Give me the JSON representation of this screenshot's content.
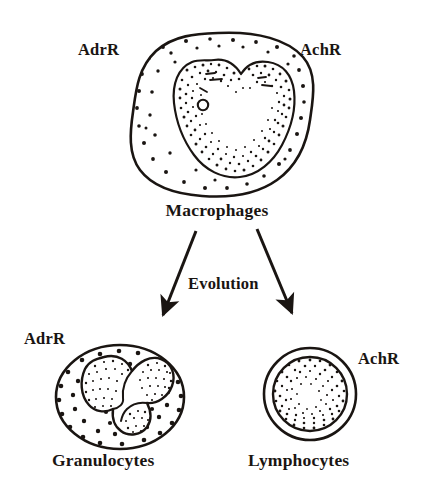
{
  "figure": {
    "kind": "biological-lineage-diagram",
    "background_color": "#ffffff",
    "ink_color": "#1a1512",
    "title_present": false
  },
  "cells": {
    "macrophage": {
      "name": "Macrophages",
      "receptor_left": "AdrR",
      "receptor_right": "AchR",
      "shape": "irregular amoeboid blob",
      "nucleus": "large bean-shaped / kidney-shaped indented nucleus",
      "nucleolus": "small open circle",
      "cytoplasm_texture": "sparse scattered dots",
      "nucleus_texture": "dense stippling concentrated along the nuclear rim"
    },
    "granulocyte": {
      "name": "Granulocytes",
      "receptor_left": "AdrR",
      "shape": "rounded oval",
      "nucleus": "three connected lobes (polymorphonuclear)",
      "cytoplasm_texture": "evenly spaced granule dots",
      "nucleus_texture": "fine stippling inside each lobe"
    },
    "lymphocyte": {
      "name": "Lymphocytes",
      "receptor_right": "AchR",
      "shape": "circle with thin cytoplasm rim",
      "nucleus": "large round nucleus filling most of the cell",
      "cytoplasm_texture": "clear narrow rim",
      "nucleus_texture": "dense stippled ring"
    }
  },
  "process": {
    "label": "Evolution",
    "from": "Macrophages",
    "to": [
      "Granulocytes",
      "Lymphocytes"
    ],
    "arrow_count": 2
  },
  "labels": {
    "adrr_macrophage": "AdrR",
    "achr_macrophage": "AchR",
    "macrophages": "Macrophages",
    "evolution": "Evolution",
    "adrr_granulocyte": "AdrR",
    "achr_lymphocyte": "AchR",
    "granulocytes": "Granulocytes",
    "lymphocytes": "Lymphocytes"
  }
}
